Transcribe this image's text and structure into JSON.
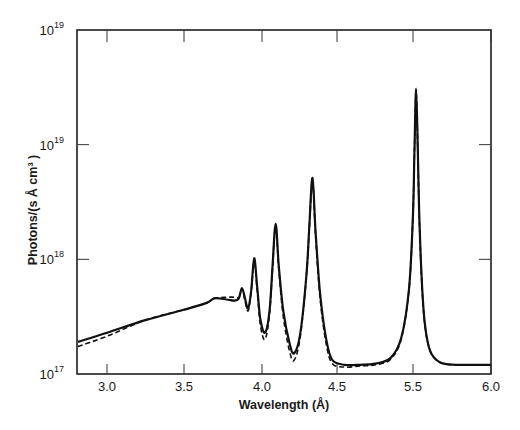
{
  "chart_data": {
    "type": "line",
    "title": "",
    "xlabel": "Wavelength (Å)",
    "ylabel": "Photons/(s Å cm³ )",
    "yscale": "log",
    "xlim": [
      2.8,
      6.0
    ],
    "ylim": [
      1e+17,
      1e+20
    ],
    "grid": false,
    "legend": null,
    "x_ticks": [
      {
        "label": "3.0",
        "px": 107
      },
      {
        "label": "3.5",
        "px": 184
      },
      {
        "label": "4.0",
        "px": 262
      },
      {
        "label": "4.5",
        "px": 337
      },
      {
        "label": "5.5",
        "px": 413
      },
      {
        "label": "6.0",
        "px": 491
      }
    ],
    "y_ticks": [
      {
        "base": "10",
        "exp": "17",
        "value": 1e+17
      },
      {
        "base": "10",
        "exp": "18",
        "value": 1e+18
      },
      {
        "base": "10",
        "exp": "19",
        "value": 1e+19
      },
      {
        "base": "10",
        "exp": "19",
        "value": 1e+20
      }
    ],
    "series": [
      {
        "name": "solid",
        "style": "solid",
        "x": [
          2.81,
          3.0,
          3.25,
          3.5,
          3.65,
          3.7,
          3.78,
          3.83,
          3.86,
          3.88,
          3.9,
          3.92,
          3.94,
          3.96,
          3.98,
          4.0,
          4.03,
          4.06,
          4.08,
          4.1,
          4.12,
          4.15,
          4.19,
          4.22,
          4.26,
          4.3,
          4.32,
          4.34,
          4.36,
          4.39,
          4.43,
          4.47,
          4.55,
          4.65,
          4.75,
          4.85,
          4.92,
          4.97,
          5.0,
          5.02,
          5.04,
          5.06,
          5.08,
          5.11,
          5.15,
          5.22,
          5.35,
          5.55,
          5.8,
          6.0
        ],
        "log10_y": [
          17.28,
          17.36,
          17.47,
          17.56,
          17.62,
          17.66,
          17.65,
          17.64,
          17.66,
          17.75,
          17.66,
          17.57,
          17.72,
          18.01,
          17.75,
          17.48,
          17.36,
          17.55,
          17.95,
          18.31,
          17.95,
          17.55,
          17.27,
          17.18,
          17.35,
          17.85,
          18.3,
          18.71,
          18.25,
          17.7,
          17.3,
          17.12,
          17.08,
          17.08,
          17.09,
          17.14,
          17.32,
          17.75,
          18.4,
          19.0,
          19.49,
          19.0,
          18.4,
          17.85,
          17.45,
          17.2,
          17.1,
          17.08,
          17.08,
          17.08
        ]
      },
      {
        "name": "dashed",
        "style": "dashed",
        "x": [
          2.81,
          3.0,
          3.25,
          3.5,
          3.65,
          3.7,
          3.78,
          3.83,
          3.86,
          3.88,
          3.9,
          3.92,
          3.94,
          3.96,
          3.98,
          4.0,
          4.03,
          4.06,
          4.08,
          4.1,
          4.12,
          4.15,
          4.19,
          4.22,
          4.26,
          4.3,
          4.32,
          4.34,
          4.36,
          4.39,
          4.43,
          4.47,
          4.55,
          4.65,
          4.75,
          4.85,
          4.92,
          4.97,
          5.0,
          5.02,
          5.04,
          5.06,
          5.08,
          5.11,
          5.15,
          5.22,
          5.35,
          5.55,
          5.8,
          6.0
        ],
        "log10_y": [
          17.24,
          17.33,
          17.47,
          17.56,
          17.62,
          17.66,
          17.67,
          17.67,
          17.67,
          17.74,
          17.64,
          17.55,
          17.71,
          17.99,
          17.72,
          17.43,
          17.3,
          17.52,
          17.93,
          18.29,
          17.92,
          17.5,
          17.2,
          17.12,
          17.32,
          17.84,
          18.28,
          18.69,
          18.22,
          17.66,
          17.26,
          17.09,
          17.06,
          17.07,
          17.08,
          17.13,
          17.31,
          17.74,
          18.38,
          18.98,
          19.47,
          18.98,
          18.38,
          17.83,
          17.44,
          17.2,
          17.1,
          17.08,
          17.08,
          17.08
        ]
      }
    ],
    "annotations": []
  },
  "labels": {
    "xlabel": "Wavelength (Å)",
    "ylabel": "Photons/(s Å cm³ )",
    "ytick_base": "10"
  }
}
